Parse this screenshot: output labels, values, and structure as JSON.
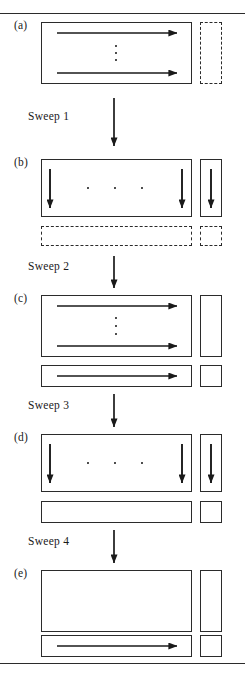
{
  "figure": {
    "type": "diagram",
    "title_visible": false,
    "canvas": {
      "width": 245,
      "height": 678,
      "background": "#ffffff",
      "ink": "#2b2b2b"
    },
    "rules": [
      {
        "name": "top-rule",
        "y": 13
      },
      {
        "name": "bottom-rule",
        "y": 663
      }
    ],
    "panels": [
      {
        "id": "a",
        "label": "(a)",
        "label_x": 14,
        "label_y": 26,
        "main_box": {
          "x": 41,
          "y": 22,
          "w": 151,
          "h": 62,
          "style": "solid"
        },
        "side_box": {
          "x": 200,
          "y": 22,
          "w": 22,
          "h": 62,
          "style": "dashed"
        },
        "bottom_bar": null,
        "bottom_small_box": null,
        "arrows": [
          {
            "type": "right",
            "x1": 57,
            "y1": 33,
            "x2": 177,
            "y2": 33
          },
          {
            "type": "right",
            "x1": 57,
            "y1": 73,
            "x2": 177,
            "y2": 73
          }
        ],
        "dots": {
          "orientation": "vertical",
          "cx": 116,
          "positions": [
            46,
            53,
            60
          ]
        }
      },
      {
        "id": "b",
        "label": "(b)",
        "label_x": 14,
        "label_y": 163,
        "main_box": {
          "x": 41,
          "y": 159,
          "w": 151,
          "h": 58,
          "style": "solid"
        },
        "side_box": {
          "x": 200,
          "y": 159,
          "w": 22,
          "h": 58,
          "style": "solid"
        },
        "bottom_bar": {
          "x": 41,
          "y": 226,
          "w": 151,
          "h": 20,
          "style": "dashed"
        },
        "bottom_small_box": {
          "x": 200,
          "y": 226,
          "w": 22,
          "h": 20,
          "style": "dashed"
        },
        "arrows": [
          {
            "type": "down",
            "x1": 50,
            "y1": 170,
            "x2": 50,
            "y2": 207
          },
          {
            "type": "down",
            "x1": 182,
            "y1": 170,
            "x2": 182,
            "y2": 207
          },
          {
            "type": "down",
            "x1": 211,
            "y1": 170,
            "x2": 211,
            "y2": 207
          }
        ],
        "dots": {
          "orientation": "horizontal",
          "cy": 188,
          "positions": [
            87,
            114,
            141
          ]
        }
      },
      {
        "id": "c",
        "label": "(c)",
        "label_x": 14,
        "label_y": 299,
        "main_box": {
          "x": 41,
          "y": 295,
          "w": 151,
          "h": 62,
          "style": "solid"
        },
        "side_box": {
          "x": 200,
          "y": 295,
          "w": 22,
          "h": 62,
          "style": "solid"
        },
        "bottom_bar": {
          "x": 41,
          "y": 365,
          "w": 151,
          "h": 22,
          "style": "solid"
        },
        "bottom_small_box": {
          "x": 200,
          "y": 365,
          "w": 22,
          "h": 22,
          "style": "solid"
        },
        "arrows": [
          {
            "type": "right",
            "x1": 57,
            "y1": 306,
            "x2": 177,
            "y2": 306
          },
          {
            "type": "right",
            "x1": 57,
            "y1": 346,
            "x2": 177,
            "y2": 346
          },
          {
            "type": "right",
            "x1": 57,
            "y1": 376,
            "x2": 177,
            "y2": 376
          }
        ],
        "dots": {
          "orientation": "vertical",
          "cx": 116,
          "positions": [
            318,
            326,
            334
          ]
        }
      },
      {
        "id": "d",
        "label": "(d)",
        "label_x": 14,
        "label_y": 438,
        "main_box": {
          "x": 41,
          "y": 434,
          "w": 151,
          "h": 58,
          "style": "solid"
        },
        "side_box": {
          "x": 200,
          "y": 434,
          "w": 22,
          "h": 58,
          "style": "solid"
        },
        "bottom_bar": {
          "x": 41,
          "y": 501,
          "w": 151,
          "h": 22,
          "style": "solid"
        },
        "bottom_small_box": {
          "x": 200,
          "y": 501,
          "w": 22,
          "h": 22,
          "style": "solid"
        },
        "arrows": [
          {
            "type": "down",
            "x1": 50,
            "y1": 445,
            "x2": 50,
            "y2": 482
          },
          {
            "type": "down",
            "x1": 182,
            "y1": 445,
            "x2": 182,
            "y2": 482
          },
          {
            "type": "down",
            "x1": 211,
            "y1": 445,
            "x2": 211,
            "y2": 482
          }
        ],
        "dots": {
          "orientation": "horizontal",
          "cy": 463,
          "positions": [
            87,
            114,
            141
          ]
        }
      },
      {
        "id": "e",
        "label": "(e)",
        "label_x": 14,
        "label_y": 574,
        "main_box": {
          "x": 41,
          "y": 570,
          "w": 151,
          "h": 62,
          "style": "solid"
        },
        "side_box": {
          "x": 200,
          "y": 570,
          "w": 22,
          "h": 62,
          "style": "solid"
        },
        "bottom_bar": {
          "x": 41,
          "y": 635,
          "w": 151,
          "h": 22,
          "style": "solid"
        },
        "bottom_small_box": {
          "x": 200,
          "y": 635,
          "w": 22,
          "h": 22,
          "style": "solid"
        },
        "arrows": [
          {
            "type": "right",
            "x1": 57,
            "y1": 646,
            "x2": 177,
            "y2": 646
          }
        ],
        "dots": null
      }
    ],
    "sweeps": [
      {
        "id": "sweep-1",
        "label": "Sweep 1",
        "label_x": 28,
        "label_y": 117,
        "arrow": {
          "x": 114,
          "y1": 98,
          "y2": 146
        }
      },
      {
        "id": "sweep-2",
        "label": "Sweep 2",
        "label_x": 28,
        "label_y": 267,
        "arrow": {
          "x": 114,
          "y1": 256,
          "y2": 288
        }
      },
      {
        "id": "sweep-3",
        "label": "Sweep 3",
        "label_x": 28,
        "label_y": 406,
        "arrow": {
          "x": 114,
          "y1": 394,
          "y2": 427
        }
      },
      {
        "id": "sweep-4",
        "label": "Sweep 4",
        "label_x": 28,
        "label_y": 542,
        "arrow": {
          "x": 114,
          "y1": 530,
          "y2": 563
        }
      }
    ]
  }
}
